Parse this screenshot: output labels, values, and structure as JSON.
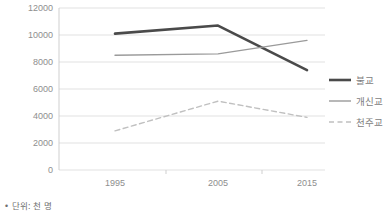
{
  "footnote": "• 단위: 천 명",
  "legend": {
    "position": "right",
    "items": [
      {
        "label": "불교",
        "color": "#4a4a4a",
        "style": "solid",
        "width": 2.6
      },
      {
        "label": "개신교",
        "color": "#9a9a9a",
        "style": "solid",
        "width": 1.4
      },
      {
        "label": "천주교",
        "color": "#c0c0c0",
        "style": "dashed",
        "width": 1.4
      }
    ]
  },
  "chart_data": {
    "type": "line",
    "title": "",
    "xlabel": "",
    "ylabel": "",
    "categories": [
      "1995",
      "2005",
      "2015"
    ],
    "x": [
      1995,
      2005,
      2015
    ],
    "xtick_labels": [
      "1995",
      "2005",
      "2015"
    ],
    "ytick_labels": [
      "0",
      "2000",
      "4000",
      "6000",
      "8000",
      "10000",
      "12000"
    ],
    "yticks": [
      0,
      2000,
      4000,
      6000,
      8000,
      10000,
      12000
    ],
    "ylim": [
      0,
      12000
    ],
    "grid": true,
    "grid_axis": "y",
    "legend_position": "right",
    "series": [
      {
        "name": "불교",
        "values": [
          10100,
          10700,
          7400
        ],
        "color": "#4a4a4a",
        "style": "solid"
      },
      {
        "name": "개신교",
        "values": [
          8500,
          8600,
          9600
        ],
        "color": "#9a9a9a",
        "style": "solid"
      },
      {
        "name": "천주교",
        "values": [
          2900,
          5100,
          3900
        ],
        "color": "#c0c0c0",
        "style": "dashed"
      }
    ]
  }
}
